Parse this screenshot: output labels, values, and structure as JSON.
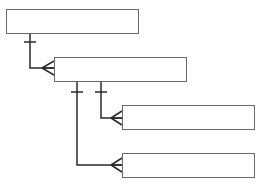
{
  "diagram": {
    "type": "entity-relationship",
    "notation": "crow's foot",
    "entities": [
      {
        "id": "entity-1",
        "label": "",
        "x": 6,
        "y": 9,
        "w": 133,
        "h": 25
      },
      {
        "id": "entity-2",
        "label": "",
        "x": 54,
        "y": 57,
        "w": 133,
        "h": 25
      },
      {
        "id": "entity-3",
        "label": "",
        "x": 122,
        "y": 105,
        "w": 133,
        "h": 25
      },
      {
        "id": "entity-4",
        "label": "",
        "x": 122,
        "y": 153,
        "w": 133,
        "h": 25
      }
    ],
    "relationships": [
      {
        "from": "entity-1",
        "to": "entity-2",
        "from_end": "one",
        "to_end": "many"
      },
      {
        "from": "entity-2",
        "to": "entity-3",
        "from_end": "one",
        "to_end": "many"
      },
      {
        "from": "entity-2",
        "to": "entity-4",
        "from_end": "one",
        "to_end": "many"
      }
    ],
    "colors": {
      "line": "#2a2a2a",
      "box_border": "#6a6a6a",
      "background": "#ffffff"
    }
  }
}
